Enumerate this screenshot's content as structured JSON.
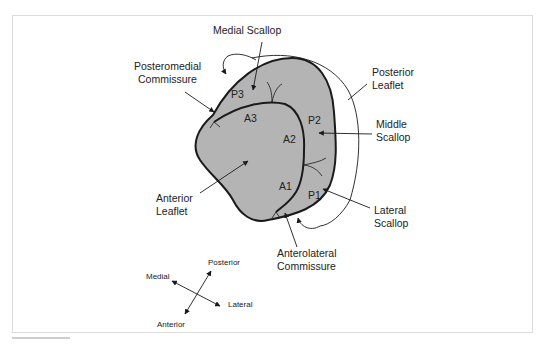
{
  "diagram": {
    "colors": {
      "leaflet_fill": "#b4b4b4",
      "outline": "#1a1a1a",
      "label": "#222222",
      "frame_border": "#dcdcdc"
    },
    "labels": {
      "medial_scallop": "Medial Scallop",
      "posteromedial_commissure_1": "Posteromedial",
      "posteromedial_commissure_2": "Commissure",
      "posterior_leaflet_1": "Posterior",
      "posterior_leaflet_2": "Leaflet",
      "middle_scallop_1": "Middle",
      "middle_scallop_2": "Scallop",
      "anterior_leaflet_1": "Anterior",
      "anterior_leaflet_2": "Leaflet",
      "lateral_scallop_1": "Lateral",
      "lateral_scallop_2": "Scallop",
      "anterolateral_commissure_1": "Anterolateral",
      "anterolateral_commissure_2": "Commissure"
    },
    "segments": {
      "p1": "P1",
      "p2": "P2",
      "p3": "P3",
      "a1": "A1",
      "a2": "A2",
      "a3": "A3"
    },
    "orientation": {
      "medial": "Medial",
      "lateral": "Lateral",
      "posterior": "Posterior",
      "anterior": "Anterior"
    }
  }
}
